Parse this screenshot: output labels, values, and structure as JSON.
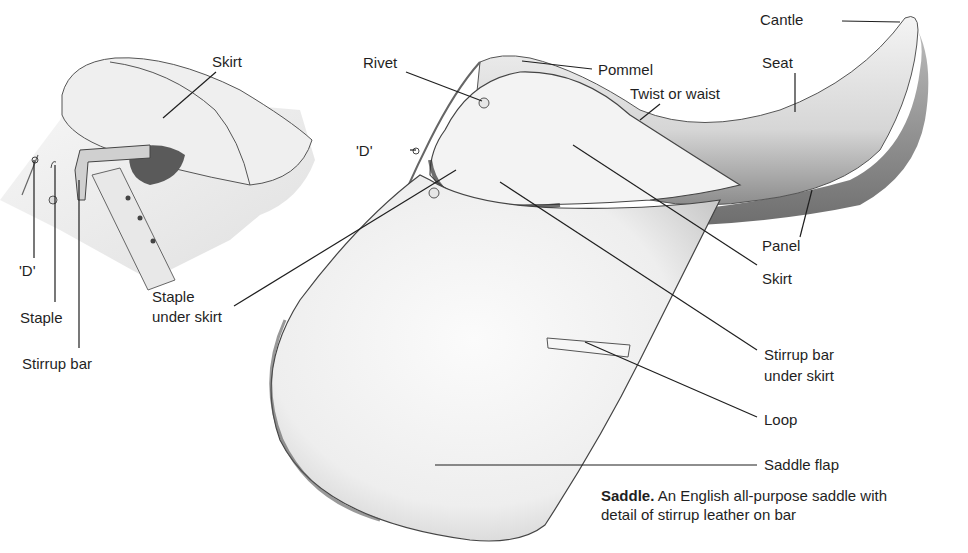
{
  "figure": {
    "title": "Saddle",
    "caption": {
      "title": "Saddle.",
      "text_line1": "An English all-purpose saddle with",
      "text_line2": "detail of stirrup leather on bar"
    }
  },
  "detail_inset": {
    "labels": {
      "skirt": "Skirt",
      "d_ring": "'D'",
      "staple": "Staple",
      "stirrup_bar": "Stirrup bar",
      "staple_under_skirt_1": "Staple",
      "staple_under_skirt_2": "under skirt"
    }
  },
  "main_saddle": {
    "labels": {
      "rivet": "Rivet",
      "pommel": "Pommel",
      "twist": "Twist or waist",
      "cantle": "Cantle",
      "seat": "Seat",
      "d_ring": "'D'",
      "panel": "Panel",
      "skirt": "Skirt",
      "stirrup_bar_1": "Stirrup bar",
      "stirrup_bar_2": "under skirt",
      "loop": "Loop",
      "saddle_flap": "Saddle flap"
    }
  },
  "colors": {
    "background": "#ffffff",
    "ink": "#1f1f1f",
    "leather_light": "#f2f2f2",
    "leather_shadow": "#9a9a9a"
  }
}
